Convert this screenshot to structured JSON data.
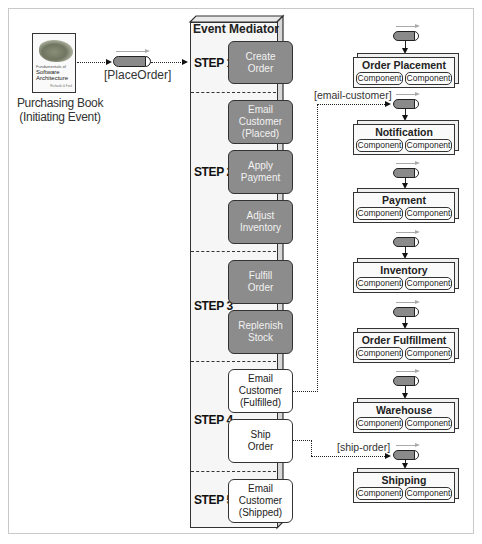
{
  "initiator": {
    "book_cover": {
      "series": "Fundamentals of",
      "title_line1": "Software",
      "title_line2": "Architecture",
      "author": "Richards & Ford"
    },
    "label_line1": "Purchasing Book",
    "label_line2": "(Initiating Event)"
  },
  "initial_queue": {
    "label": "[PlaceOrder]"
  },
  "mediator": {
    "title": "Event Mediator",
    "steps": [
      {
        "label": "STEP 1",
        "tasks": [
          {
            "lines": [
              "Create",
              "Order"
            ],
            "style": "gray"
          }
        ]
      },
      {
        "label": "STEP 2",
        "tasks": [
          {
            "lines": [
              "Email",
              "Customer",
              "(Placed)"
            ],
            "style": "gray"
          },
          {
            "lines": [
              "Apply",
              "Payment"
            ],
            "style": "gray"
          },
          {
            "lines": [
              "Adjust",
              "Inventory"
            ],
            "style": "gray"
          }
        ]
      },
      {
        "label": "STEP 3",
        "tasks": [
          {
            "lines": [
              "Fulfill",
              "Order"
            ],
            "style": "gray"
          },
          {
            "lines": [
              "Replenish",
              "Stock"
            ],
            "style": "gray"
          }
        ]
      },
      {
        "label": "STEP 4",
        "tasks": [
          {
            "lines": [
              "Email",
              "Customer",
              "(Fulfilled)"
            ],
            "style": "white"
          },
          {
            "lines": [
              "Ship",
              "Order"
            ],
            "style": "white"
          }
        ]
      },
      {
        "label": "STEP 5",
        "tasks": [
          {
            "lines": [
              "Email",
              "Customer",
              "(Shipped)"
            ],
            "style": "white"
          }
        ]
      }
    ]
  },
  "channels": {
    "email_customer": "[email-customer]",
    "ship_order": "[ship-order]"
  },
  "services": [
    {
      "name": "Order Placement",
      "components": [
        "Component",
        "Component"
      ]
    },
    {
      "name": "Notification",
      "components": [
        "Component",
        "Component"
      ]
    },
    {
      "name": "Payment",
      "components": [
        "Component",
        "Component"
      ]
    },
    {
      "name": "Inventory",
      "components": [
        "Component",
        "Component"
      ]
    },
    {
      "name": "Order Fulfillment",
      "components": [
        "Component",
        "Component"
      ]
    },
    {
      "name": "Warehouse",
      "components": [
        "Component",
        "Component"
      ]
    },
    {
      "name": "Shipping",
      "components": [
        "Component",
        "Component"
      ]
    }
  ],
  "colors": {
    "processed_task": "#8c8c8c",
    "pending_task": "#ffffff",
    "queue_fill": "#8a8a8a",
    "flow_arrow": "#aaaaaa"
  }
}
